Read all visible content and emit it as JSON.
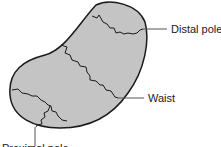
{
  "figure": {
    "labels": {
      "distal_pole": "Distal pole",
      "waist": "Waist",
      "proximal_pole": "Proximal pole"
    },
    "colors": {
      "bone_fill": "#c4c4c4",
      "outline": "#1a1a1a",
      "leader_line": "#555555"
    }
  }
}
